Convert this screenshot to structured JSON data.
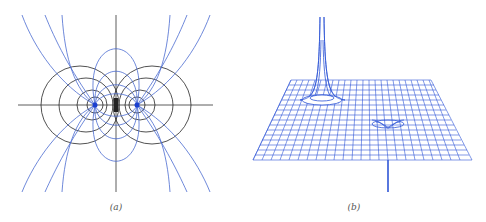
{
  "figure": {
    "panels": [
      {
        "id": "a",
        "label": "(a)",
        "description": "Electric dipole: equipotential lines (black) and field lines (blue) around two point charges",
        "colors": {
          "field_lines": "#3c5ec8",
          "equipotentials": "#222222",
          "charges": "#1a3fd0"
        }
      },
      {
        "id": "b",
        "label": "(b)",
        "description": "3D surface plot of potential of a dipole: upward spike at positive charge, downward spike at negative charge",
        "colors": {
          "mesh": "#2f56d6"
        }
      }
    ]
  }
}
